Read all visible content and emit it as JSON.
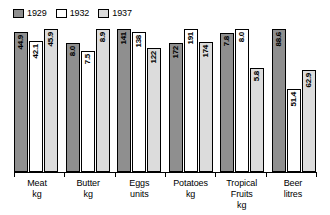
{
  "chart_data": {
    "type": "bar",
    "title": "",
    "subtitle": "",
    "xlabel": "",
    "ylabel": "",
    "grid": false,
    "legend_position": "top-left",
    "note": "Each category group is independently scaled to its own maximum; no shared y-axis or tick labels are shown.",
    "categories": [
      "Meat",
      "Butter",
      "Eggs",
      "Potatoes",
      "Tropical Fruits",
      "Beer"
    ],
    "category_units": [
      "kg",
      "kg",
      "units",
      "kg",
      "kg",
      "litres"
    ],
    "series": [
      {
        "name": "1929",
        "color": "#8f8f8f",
        "values": [
          44.9,
          8.0,
          141,
          172,
          7.8,
          88.6
        ]
      },
      {
        "name": "1932",
        "color": "#ffffff",
        "values": [
          42.1,
          7.5,
          138,
          191,
          8.0,
          51.4
        ]
      },
      {
        "name": "1937",
        "color": "#dcdcdc",
        "values": [
          45.9,
          8.9,
          122,
          174,
          5.8,
          62.9
        ]
      }
    ],
    "value_labels": [
      [
        "44.9",
        "42.1",
        "45.9"
      ],
      [
        "8.0",
        "7.5",
        "8.9"
      ],
      [
        "141",
        "138",
        "122"
      ],
      [
        "172",
        "191",
        "174"
      ],
      [
        "7.8",
        "8.0",
        "5.8"
      ],
      [
        "88.6",
        "51.4",
        "62.9"
      ]
    ]
  },
  "legend": {
    "entries": [
      {
        "label": "1929",
        "color": "#8f8f8f"
      },
      {
        "label": "1932",
        "color": "#ffffff"
      },
      {
        "label": "1937",
        "color": "#dcdcdc"
      }
    ]
  },
  "axis": {
    "categories": [
      {
        "name": "Meat",
        "unit": "kg"
      },
      {
        "name": "Butter",
        "unit": "kg"
      },
      {
        "name": "Eggs",
        "unit": "units"
      },
      {
        "name": "Potatoes",
        "unit": "kg"
      },
      {
        "name": "Tropical Fruits",
        "unit": "kg"
      },
      {
        "name": "Beer",
        "unit": "litres"
      }
    ]
  }
}
